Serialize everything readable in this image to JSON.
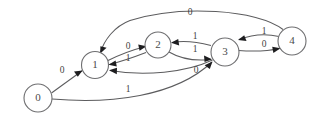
{
  "diagram": {
    "type": "finite-state-machine",
    "background_color": "#ffffff",
    "node_stroke_color": "#6e6e70",
    "edge_stroke_color": "#5c5c5e",
    "arrow_color": "#1d1d1f",
    "nodes": [
      {
        "id": "n0",
        "label": "0",
        "cx": 38,
        "cy": 98,
        "r": 14
      },
      {
        "id": "n1",
        "label": "1",
        "cx": 95,
        "cy": 65,
        "r": 13.5
      },
      {
        "id": "n2",
        "label": "2",
        "cx": 158,
        "cy": 45,
        "r": 13
      },
      {
        "id": "n3",
        "label": "3",
        "cx": 225,
        "cy": 52,
        "r": 14
      },
      {
        "id": "n4",
        "label": "4",
        "cx": 292,
        "cy": 41,
        "r": 14
      }
    ],
    "edges": [
      {
        "id": "e0",
        "from": "0",
        "to": "1",
        "label": "0",
        "label_x": 62,
        "label_y": 71
      },
      {
        "id": "e1",
        "from": "0",
        "to": "3",
        "label": "1",
        "label_x": 128,
        "label_y": 90
      },
      {
        "id": "e2",
        "from": "1",
        "to": "2",
        "label": "0",
        "label_x": 128,
        "label_y": 47
      },
      {
        "id": "e3",
        "from": "2",
        "to": "1",
        "label": "1",
        "label_x": 128,
        "label_y": 59
      },
      {
        "id": "e4",
        "from": "2",
        "to": "3",
        "label": "1",
        "label_x": 195,
        "label_y": 50
      },
      {
        "id": "e5",
        "from": "3",
        "to": "2",
        "label": "1",
        "label_x": 195,
        "label_y": 37
      },
      {
        "id": "e6",
        "from": "3",
        "to": "4",
        "label": "0",
        "label_x": 264,
        "label_y": 45
      },
      {
        "id": "e7",
        "from": "4",
        "to": "3",
        "label": "1",
        "label_x": 264,
        "label_y": 32
      },
      {
        "id": "e8",
        "from": "4",
        "to": "1",
        "label": "0",
        "label_x": 190,
        "label_y": 13
      },
      {
        "id": "e9",
        "from": "3",
        "to": "1",
        "label": "0",
        "label_x": 196,
        "label_y": 71
      }
    ]
  }
}
